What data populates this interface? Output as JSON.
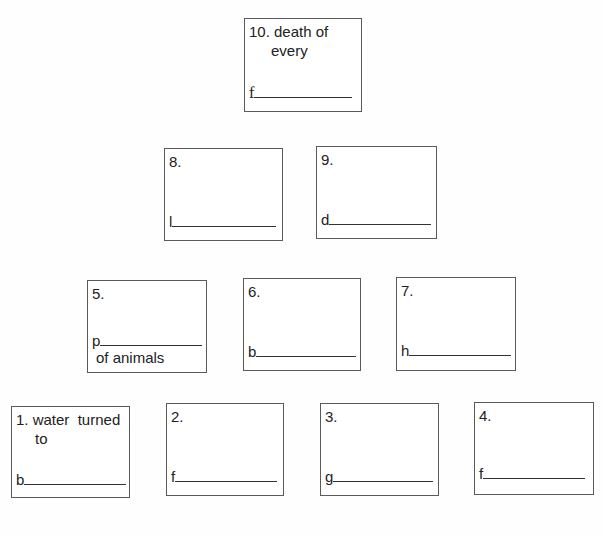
{
  "worksheet": {
    "boxes": [
      {
        "id": 10,
        "number": "10.",
        "clue_line1": "death of",
        "clue_line2": "every",
        "letter": "f",
        "after": ""
      },
      {
        "id": 8,
        "number": "8.",
        "clue_line1": "",
        "clue_line2": "",
        "letter": "l",
        "after": ""
      },
      {
        "id": 9,
        "number": "9.",
        "clue_line1": "",
        "clue_line2": "",
        "letter": "d",
        "after": ""
      },
      {
        "id": 5,
        "number": "5.",
        "clue_line1": "",
        "clue_line2": "",
        "letter": "p",
        "after": "of animals"
      },
      {
        "id": 6,
        "number": "6.",
        "clue_line1": "",
        "clue_line2": "",
        "letter": "b",
        "after": ""
      },
      {
        "id": 7,
        "number": "7.",
        "clue_line1": "",
        "clue_line2": "",
        "letter": "h",
        "after": ""
      },
      {
        "id": 1,
        "number": "1.",
        "clue_line1": "water  turned",
        "clue_line2": "to",
        "letter": "b",
        "after": ""
      },
      {
        "id": 2,
        "number": "2.",
        "clue_line1": "",
        "clue_line2": "",
        "letter": "f",
        "after": ""
      },
      {
        "id": 3,
        "number": "3.",
        "clue_line1": "",
        "clue_line2": "",
        "letter": "g",
        "after": ""
      },
      {
        "id": 4,
        "number": "4.",
        "clue_line1": "",
        "clue_line2": "",
        "letter": "f",
        "after": ""
      }
    ]
  }
}
